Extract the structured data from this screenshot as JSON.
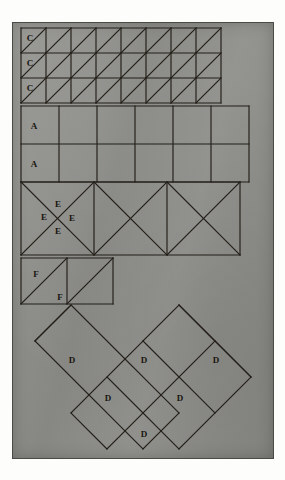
{
  "plate": {
    "title": "Geometric tiling plate",
    "background_color": "#8e8e8a",
    "ink_color": "#231f18",
    "border_color": "#4a4a46"
  },
  "figures": [
    {
      "id": "figure-c",
      "name": "triangle-grid-c",
      "label": "C",
      "label_count": 3,
      "shape": "square-grid-with-diagonals",
      "columns": 8,
      "rows": 3,
      "cell_size": 25,
      "origin": [
        8,
        5
      ],
      "diagonal": "bottom-left-to-top-right",
      "labels": [
        {
          "text": "C",
          "x": 17,
          "y": 18
        },
        {
          "text": "C",
          "x": 17,
          "y": 43
        },
        {
          "text": "C",
          "x": 17,
          "y": 68
        }
      ]
    },
    {
      "id": "figure-a",
      "name": "plain-square-grid-a",
      "label": "A",
      "label_count": 2,
      "shape": "square-grid",
      "columns": 6,
      "rows": 2,
      "cell_size": 38,
      "origin": [
        8,
        83
      ],
      "labels": [
        {
          "text": "A",
          "x": 21,
          "y": 105
        },
        {
          "text": "A",
          "x": 21,
          "y": 143
        }
      ]
    },
    {
      "id": "figure-e",
      "name": "x-square-row-e",
      "label": "E",
      "label_count": 4,
      "shape": "square-row-with-both-diagonals",
      "columns": 3,
      "rows": 1,
      "cell_size": 73,
      "origin": [
        8,
        155
      ],
      "labels": [
        {
          "text": "E",
          "x": 33,
          "y": 183
        },
        {
          "text": "E",
          "x": 46,
          "y": 173
        },
        {
          "text": "E",
          "x": 59,
          "y": 183
        },
        {
          "text": "E",
          "x": 46,
          "y": 196
        }
      ]
    },
    {
      "id": "figure-f",
      "name": "antidiagonal-square-pair-f",
      "label": "F",
      "label_count": 2,
      "shape": "square-pair-with-antidiagonal",
      "columns": 2,
      "rows": 1,
      "cell_size": 46,
      "origin": [
        8,
        233
      ],
      "labels": [
        {
          "text": "F",
          "x": 24,
          "y": 253
        },
        {
          "text": "F",
          "x": 48,
          "y": 274
        }
      ]
    },
    {
      "id": "figure-d",
      "name": "diamond-lattice-d",
      "label": "D",
      "label_count": 6,
      "shape": "rotated-square-lattice",
      "rows": [
        3,
        2,
        1
      ],
      "cell_size": 58,
      "origin": [
        58,
        288
      ],
      "labels": [
        {
          "text": "D",
          "x": 71,
          "y": 336
        },
        {
          "text": "D",
          "x": 142,
          "y": 336
        },
        {
          "text": "D",
          "x": 213,
          "y": 336
        },
        {
          "text": "D",
          "x": 107,
          "y": 375
        },
        {
          "text": "D",
          "x": 178,
          "y": 375
        },
        {
          "text": "D",
          "x": 142,
          "y": 415
        }
      ]
    }
  ]
}
